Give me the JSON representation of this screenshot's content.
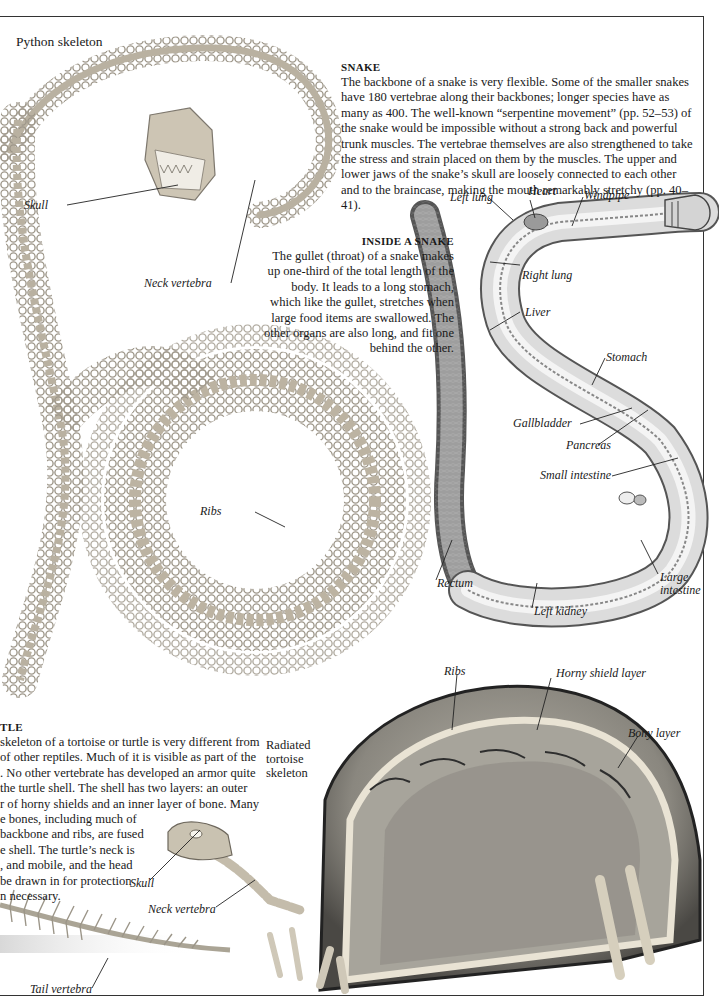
{
  "page": {
    "python_title": "Python skeleton",
    "tortoise_title": "Radiated tortoise skeleton"
  },
  "snake_section": {
    "heading": "SNAKE",
    "body": "The backbone of a snake is very flexible. Some of the smaller snakes have 180 vertebrae along their backbones; longer species have as many as 400. The well-known “serpentine movement” (pp. 52–53) of the snake would be impossible without a strong back and powerful trunk muscles. The vertebrae themselves are also strengthened to take the stress and strain placed on them by the muscles. The upper and lower jaws of the snake’s skull are loosely connected to each other and to the braincase, making the mouth remarkably stretchy (pp. 40–41)."
  },
  "inside_snake_section": {
    "heading": "INSIDE A SNAKE",
    "body": "The gullet (throat) of a snake makes up one-third of the total length of the body. It leads to a long stomach, which like the gullet, stretches when large food items are swallowed. The other organs are also long, and fit one behind the other."
  },
  "turtle_section": {
    "heading": "TLE",
    "lines": [
      "skeleton of a tortoise or turtle is very different from",
      "of other reptiles. Much of it is visible as part of the",
      ". No other vertebrate has developed an armor quite",
      "the turtle shell. The shell has two layers: an outer",
      "r of horny shields and an inner layer of bone. Many",
      "e bones, including much of",
      "backbone and ribs, are fused",
      "e shell. The turtle’s neck is",
      ", and mobile, and the head",
      "be drawn in for protection",
      "n necessary."
    ]
  },
  "python_labels": {
    "skull": "Skull",
    "neck_vertebra": "Neck vertebra",
    "ribs": "Ribs"
  },
  "anatomy_labels": {
    "left_lung": "Left lung",
    "heart": "Heart",
    "windpipe": "Windpipe",
    "right_lung": "Right lung",
    "liver": "Liver",
    "stomach": "Stomach",
    "gallbladder": "Gallbladder",
    "pancreas": "Pancreas",
    "small_intestine": "Small intestine",
    "rectum": "Rectum",
    "large_intestine_1": "Large",
    "large_intestine_2": "intestine",
    "left_kidney": "Left kidney"
  },
  "tortoise_labels": {
    "ribs": "Ribs",
    "horny_shield_layer": "Horny shield layer",
    "bony_layer": "Bony layer",
    "skull": "Skull",
    "neck_vertebra": "Neck vertebra",
    "tail_vertebra": "Tail vertebra"
  },
  "colors": {
    "bone": "#cfc7b6",
    "bone_dark": "#8f877a",
    "organ_fill": "#d9d9d9",
    "shell_dark": "#3a3a3a",
    "shell_inner": "#9b9890",
    "rule": "#333333"
  }
}
